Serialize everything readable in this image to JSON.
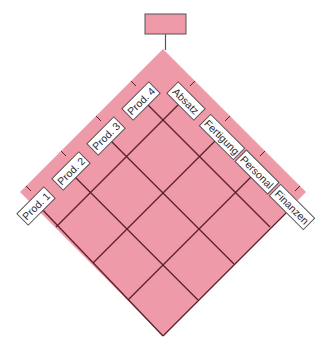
{
  "diagram": {
    "colors": {
      "fill": "#ee9aa8",
      "grid_line": "#5a1e2a",
      "box_border": "#555555",
      "label_bg": "#ffffff",
      "label_text": "#2a2a2a",
      "connector": "#555555"
    },
    "top_box": {
      "label": ""
    },
    "left_labels": [
      {
        "text": "Prod. 1"
      },
      {
        "text": "Prod. 2"
      },
      {
        "text": "Prod. 3"
      },
      {
        "text": "Prod. 4"
      }
    ],
    "right_labels": [
      {
        "text": "Absatz"
      },
      {
        "text": "Fertigung"
      },
      {
        "text": "Personal"
      },
      {
        "text": "Finanzen"
      }
    ],
    "grid": {
      "rows": 4,
      "cols": 4
    }
  }
}
